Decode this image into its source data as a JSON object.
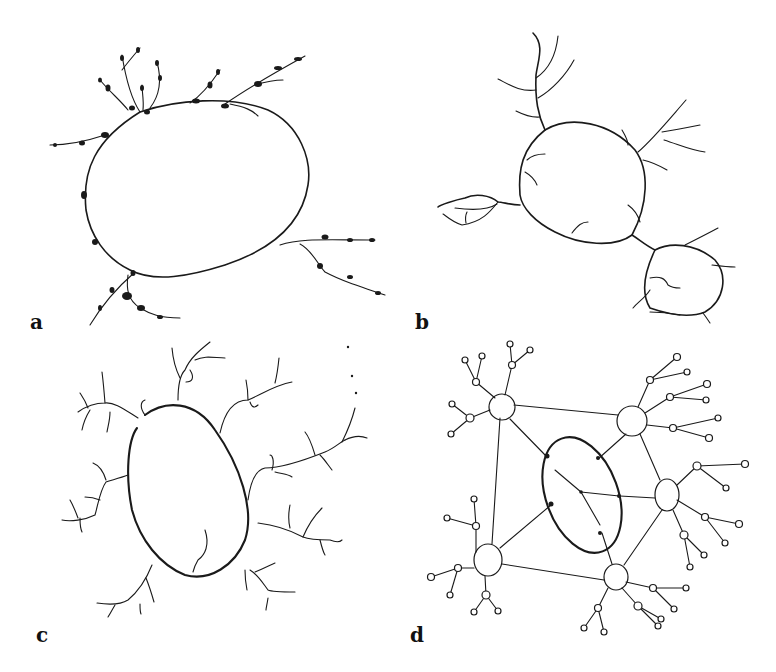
{
  "figure": {
    "panels": [
      {
        "id": "a",
        "label": "a",
        "description": "single large ring with beaded short branches"
      },
      {
        "id": "b",
        "label": "b",
        "description": "three connected irregular rings with thin branches"
      },
      {
        "id": "c",
        "label": "c",
        "description": "egg-shaped ring with faint dendritic branches"
      },
      {
        "id": "d",
        "label": "d",
        "description": "central ellipse linked to six hubs with small terminal loops"
      }
    ],
    "colors": {
      "ink": "#1a1a1a",
      "background": "#ffffff"
    }
  }
}
